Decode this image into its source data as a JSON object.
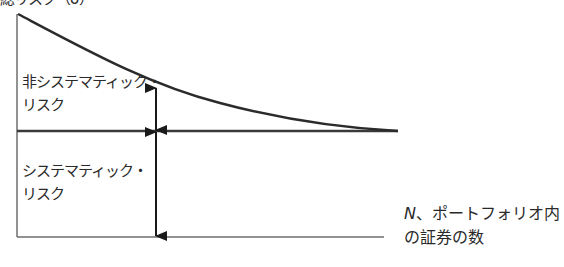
{
  "diagram": {
    "y_axis_label": "総リスク（σ）",
    "x_axis_label": {
      "variable": "N",
      "line1_rest": "、ポートフォリオ内",
      "line2": "の証券の数"
    },
    "regions": {
      "unsystematic": {
        "line1": "非システマティック・",
        "line2": "リスク"
      },
      "systematic": {
        "line1": "システマティック・",
        "line2": "リスク"
      }
    },
    "colors": {
      "line": "#2b2b2b",
      "axis": "#6e6e6e",
      "text": "#2a2a2a",
      "background": "#ffffff"
    }
  }
}
